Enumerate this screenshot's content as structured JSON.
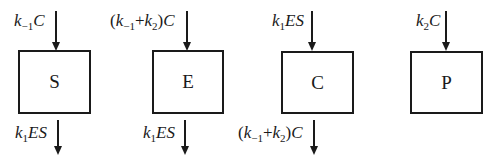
{
  "diagram": {
    "type": "compartment-flow",
    "compartments": [
      {
        "id": "S",
        "label": "S",
        "inflow": {
          "coef_prefix": "",
          "k": "k",
          "k_sub": "−1",
          "plus": "",
          "k2": "",
          "k2_sub": "",
          "suffix": "",
          "species": "C",
          "text": "k_{-1}C"
        },
        "outflow": {
          "k": "k",
          "k_sub": "1",
          "species": "ES",
          "text": "k_1ES"
        }
      },
      {
        "id": "E",
        "label": "E",
        "inflow": {
          "open": "(",
          "k": "k",
          "k_sub": "−1",
          "plus": "+",
          "k2": "k",
          "k2_sub": "2",
          "close": ")",
          "species": "C",
          "text": "(k_{-1}+k_2)C"
        },
        "outflow": {
          "k": "k",
          "k_sub": "1",
          "species": "ES",
          "text": "k_1ES"
        }
      },
      {
        "id": "C",
        "label": "C",
        "inflow": {
          "k": "k",
          "k_sub": "1",
          "species": "ES",
          "text": "k_1ES"
        },
        "outflow": {
          "open": "(",
          "k": "k",
          "k_sub": "−1",
          "plus": "+",
          "k2": "k",
          "k2_sub": "2",
          "close": ")",
          "species": "C",
          "text": "(k_{-1}+k_2)C"
        }
      },
      {
        "id": "P",
        "label": "P",
        "inflow": {
          "k": "k",
          "k_sub": "2",
          "species": "C",
          "text": "k_2C"
        },
        "outflow": null
      }
    ]
  }
}
